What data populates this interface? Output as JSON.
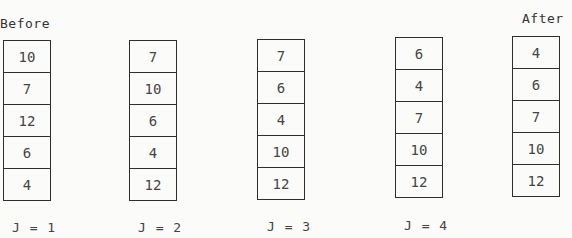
{
  "labels": {
    "before": "Before",
    "after": "After"
  },
  "columns": [
    {
      "id": "before",
      "values": [
        "10",
        "7",
        "12",
        "6",
        "4"
      ],
      "caption": "J = 1"
    },
    {
      "id": "j2",
      "values": [
        "7",
        "10",
        "6",
        "4",
        "12"
      ],
      "caption": "J = 2"
    },
    {
      "id": "j3",
      "values": [
        "7",
        "6",
        "4",
        "10",
        "12"
      ],
      "caption": "J = 3"
    },
    {
      "id": "j4",
      "values": [
        "6",
        "4",
        "7",
        "10",
        "12"
      ],
      "caption": "J = 4"
    },
    {
      "id": "after",
      "values": [
        "4",
        "6",
        "7",
        "10",
        "12"
      ],
      "caption": ""
    }
  ]
}
